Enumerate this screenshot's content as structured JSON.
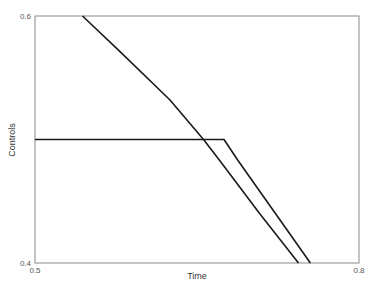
{
  "chart_data": {
    "type": "line",
    "title": "",
    "xlabel": "Time",
    "ylabel": "Controls",
    "xlim": [
      0.5,
      0.8
    ],
    "ylim": [
      0.4,
      0.6
    ],
    "x_ticks": [
      "0.5",
      "0.8"
    ],
    "y_ticks": [
      "0.4",
      "0.6"
    ],
    "grid": false,
    "legend": null,
    "series": [
      {
        "name": "control-1",
        "color": "#1a1a1a",
        "x": [
          0.5,
          0.675,
          0.688,
          0.755
        ],
        "y": [
          0.5,
          0.5,
          0.483,
          0.4
        ]
      },
      {
        "name": "control-2",
        "color": "#1a1a1a",
        "x": [
          0.544,
          0.579,
          0.625,
          0.656,
          0.671,
          0.708,
          0.744
        ],
        "y": [
          0.6,
          0.571,
          0.532,
          0.5,
          0.483,
          0.44,
          0.4
        ]
      }
    ]
  },
  "axes": {
    "xlabel": "Time",
    "ylabel": "Controls",
    "x_min_label": "0.5",
    "x_max_label": "0.8",
    "y_min_label": "0.4",
    "y_max_label": "0.6"
  }
}
